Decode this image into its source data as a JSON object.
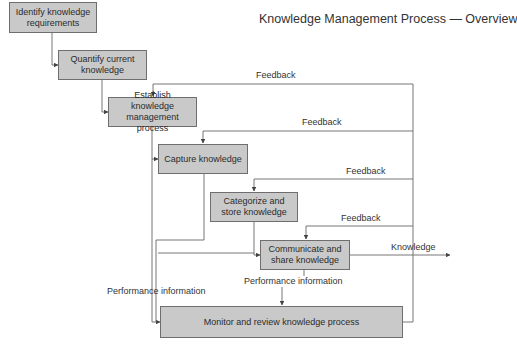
{
  "title": "Knowledge Management Process — Overview",
  "steps": [
    {
      "id": "identify",
      "label": "Identify knowledge requirements"
    },
    {
      "id": "quantify",
      "label": "Quantify current knowledge"
    },
    {
      "id": "establish",
      "label": "Establish knowledge management process"
    },
    {
      "id": "capture",
      "label": "Capture knowledge"
    },
    {
      "id": "categorize",
      "label": "Categorize and store knowledge"
    },
    {
      "id": "communicate",
      "label": "Communicate and share knowledge"
    },
    {
      "id": "monitor",
      "label": "Monitor and review knowledge process"
    }
  ],
  "edge_labels": {
    "feedback_1": "Feedback",
    "feedback_2": "Feedback",
    "feedback_3": "Feedback",
    "feedback_4": "Feedback",
    "knowledge_out": "Knowledge",
    "performance_left": "Performance information",
    "performance_center": "Performance information"
  },
  "colors": {
    "box_fill": "#c9c9c9",
    "box_border": "#6e6e6e",
    "line": "#555555"
  }
}
